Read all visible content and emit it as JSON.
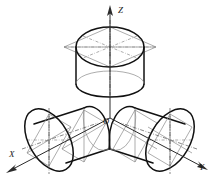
{
  "figure": {
    "background_color": "#ffffff",
    "object_line_color": "#111111",
    "construction_line_color": "#8a8a8a",
    "axis_color": "#2b2b2b",
    "label_color": "#1a1a1a"
  },
  "axes": {
    "origin_label": "O",
    "origin": {
      "x": 110,
      "y": 118
    },
    "items": [
      {
        "name": "z-axis",
        "label": "Z",
        "label_x": 118,
        "label_y": 12,
        "direction": "up",
        "tip": {
          "x": 110,
          "y": 6
        },
        "tail": {
          "x": 110,
          "y": 118
        }
      },
      {
        "name": "x-axis",
        "label": "X",
        "label_x": 11,
        "label_y": 157,
        "direction": "down-left",
        "tip": {
          "x": 7,
          "y": 172
        },
        "tail": {
          "x": 110,
          "y": 118
        }
      },
      {
        "name": "y-axis",
        "label": "Y",
        "label_x": 201,
        "label_y": 168,
        "direction": "down-right",
        "tip": {
          "x": 207,
          "y": 172
        },
        "tail": {
          "x": 110,
          "y": 118
        }
      }
    ]
  },
  "cylinders": [
    {
      "name": "cylinder-on-horizontal-plane",
      "position": "top",
      "axis": "Z",
      "description": "Vertical cylinder standing on the horizontal (XOY) plane, circular face seen as an ellipse inscribed in a rhombus",
      "center": {
        "x": 110,
        "y": 47
      },
      "height": 46
    },
    {
      "name": "cylinder-on-profile-plane",
      "position": "left",
      "axis": "X",
      "description": "Cylinder directed along the X axis, circular face seen as an ellipse inscribed in a rhombus",
      "center": {
        "x": 49,
        "y": 140
      },
      "height": 46
    },
    {
      "name": "cylinder-on-frontal-plane",
      "position": "right",
      "axis": "Y",
      "description": "Cylinder directed along the Y axis, circular face seen as an ellipse inscribed in a rhombus",
      "center": {
        "x": 170,
        "y": 140
      },
      "height": 46
    }
  ],
  "line_types": {
    "object": "thick solid",
    "construction": "thin solid",
    "center": "dash-dot"
  }
}
